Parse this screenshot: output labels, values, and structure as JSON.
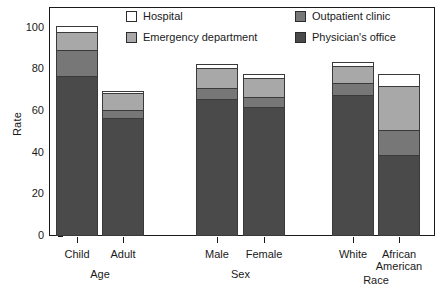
{
  "chart_data": {
    "type": "bar",
    "subtype": "stacked-bar",
    "title": "",
    "xlabel": "",
    "ylabel": "Rate",
    "ylim": [
      0,
      100
    ],
    "yticks": [
      0,
      20,
      40,
      60,
      80,
      100
    ],
    "grid": false,
    "legend_position": "top-inside",
    "categories": [
      "Child",
      "Adult",
      "Male",
      "Female",
      "White",
      "African American"
    ],
    "groups": [
      {
        "name": "Age",
        "categories": [
          "Child",
          "Adult"
        ]
      },
      {
        "name": "Sex",
        "categories": [
          "Male",
          "Female"
        ]
      },
      {
        "name": "Race",
        "categories": [
          "White",
          "African American"
        ]
      }
    ],
    "series": [
      {
        "name": "Physician's office",
        "values": [
          77.0,
          56.5,
          66.0,
          62.0,
          67.5,
          39.0
        ],
        "color": "#4a4a4a"
      },
      {
        "name": "Outpatient clinic",
        "values": [
          12.5,
          4.0,
          5.0,
          5.0,
          6.0,
          12.0
        ],
        "color": "#777777"
      },
      {
        "name": "Emergency department",
        "values": [
          8.5,
          8.0,
          9.5,
          9.0,
          8.0,
          21.0
        ],
        "color": "#a8a8a8"
      },
      {
        "name": "Hospital",
        "values": [
          3.0,
          1.0,
          2.2,
          2.0,
          2.0,
          6.0
        ],
        "color": "#ffffff"
      }
    ],
    "totals": [
      101.0,
      69.5,
      82.7,
      78.0,
      83.5,
      78.0
    ]
  },
  "axis": {
    "y_title": "Rate",
    "y_tick_labels": [
      "100",
      "80",
      "60",
      "40",
      "20",
      "0"
    ],
    "x_tick_labels": [
      "Child",
      "Adult",
      "Male",
      "Female",
      "White",
      "African\nAmerican"
    ],
    "x_tick_labels_flat": [
      "Child",
      "Adult",
      "Male",
      "Female",
      "White",
      "African American"
    ],
    "group_labels": [
      "Age",
      "Sex",
      "Race"
    ]
  },
  "legend": {
    "items": [
      {
        "label": "Hospital",
        "color": "#ffffff"
      },
      {
        "label": "Emergency department",
        "color": "#a8a8a8"
      },
      {
        "label": "Outpatient clinic",
        "color": "#777777"
      },
      {
        "label": "Physician's office",
        "color": "#4a4a4a"
      }
    ]
  },
  "colors": {
    "hospital": "#ffffff",
    "emergency_department": "#a8a8a8",
    "outpatient_clinic": "#777777",
    "physicians_office": "#4a4a4a",
    "axis": "#1a1a1a",
    "background": "#ffffff"
  }
}
